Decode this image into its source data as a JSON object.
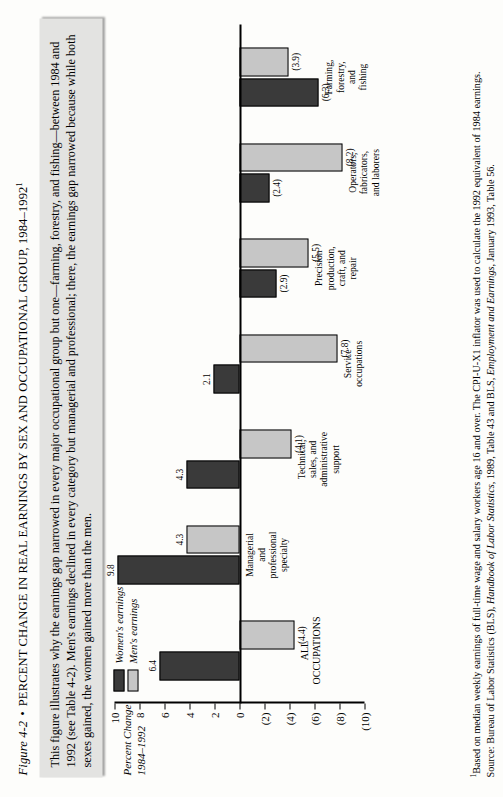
{
  "figure": {
    "number": "Figure 4-2",
    "bullet": "•",
    "title": "PERCENT CHANGE IN REAL EARNINGS BY SEX AND OCCUPATIONAL GROUP, 1984–1992",
    "title_footnote_marker": "1"
  },
  "blurb": {
    "text": "This figure illustrates why the earnings gap narrowed in every major occupational group but one—farming, forestry, and fishing—between 1984 and 1992 (see Table 4-2). Men's earnings declined in every category but managerial and professional; there, the earnings gap narrowed because while both sexes gained, the women gained more than the men."
  },
  "axis_title": {
    "line1": "Percent Change",
    "line2": "1984–1992"
  },
  "legend": {
    "items": [
      {
        "label": "Women's earnings",
        "key": "women",
        "color": "#3a3a3a"
      },
      {
        "label": "Men's earnings",
        "key": "men",
        "color": "#c6c6c6"
      }
    ]
  },
  "notes": {
    "footnote_marker": "1",
    "footnote": "Based on median weekly earnings of full-time wage and salary workers age 16 and over. The CPI-U-X1 inflator was used to calculate the 1992 equivalent of 1984 earnings.",
    "source_label": "Source:",
    "source_text_1": "Bureau of Labor Statistics (BLS), ",
    "source_italic_1": "Handbook of Labor Statistics",
    "source_text_2": ", 1989, Table 43 and BLS, ",
    "source_italic_2": "Employment and Earnings",
    "source_text_3": ", January 1993, Table 56."
  },
  "chart_data": {
    "type": "bar",
    "title": "PERCENT CHANGE IN REAL EARNINGS BY SEX AND OCCUPATIONAL GROUP, 1984–1992",
    "xlabel": "",
    "ylabel": "Percent Change 1984–1992",
    "ylim": [
      -10,
      10
    ],
    "yticks": [
      10,
      8,
      6,
      4,
      2,
      0,
      -2,
      -4,
      -6,
      -8,
      -10
    ],
    "ytick_labels": [
      "10",
      "8",
      "6",
      "4",
      "2",
      "0",
      "(2)",
      "(4)",
      "(6)",
      "(8)",
      "(10)"
    ],
    "grid": false,
    "legend_position": "upper-left",
    "orientation": "vertical",
    "categories": [
      "ALL\nOCCUPATIONS",
      "Managerial\nand\nprofessional\nspecialty",
      "Technical,\nsales, and\nadministrative\nsupport",
      "Service\noccupations",
      "Precision\nproduction,\ncraft, and\nrepair",
      "Operators,\nfabricators,\nand laborers",
      "Farming,\nforestry,\nand\nfishing"
    ],
    "series": [
      {
        "name": "Women's earnings",
        "color": "#3a3a3a",
        "values": [
          6.4,
          9.8,
          4.3,
          2.1,
          -2.9,
          -2.4,
          -6.3
        ],
        "labels": [
          "6.4",
          "9.8",
          "4.3",
          "2.1",
          "(2.9)",
          "(2.4)",
          "(6.3)"
        ]
      },
      {
        "name": "Men's earnings",
        "color": "#c6c6c6",
        "values": [
          -4.4,
          4.3,
          -4.1,
          -7.8,
          -5.5,
          -8.2,
          -3.9
        ],
        "labels": [
          "(4.4)",
          "4.3",
          "(4.1)",
          "(7.8)",
          "(5.5)",
          "(8.2)",
          "(3.9)"
        ]
      }
    ]
  }
}
